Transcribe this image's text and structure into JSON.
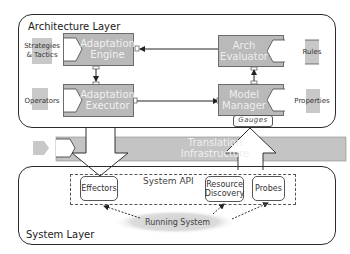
{
  "architecture_layer": {
    "title": "Architecture Layer",
    "components": {
      "adaptation_engine": [
        "Adaptation",
        "Engine"
      ],
      "adaptation_executor": [
        "Adaptation",
        "Executor"
      ],
      "arch_evaluator": [
        "Arch",
        "Evaluator"
      ],
      "model_manager": [
        "Model",
        "Manager"
      ]
    },
    "inputs_left": [
      {
        "label_lines": [
          "Strategies",
          "& Tactics"
        ]
      },
      {
        "label_lines": [
          "Operators"
        ]
      }
    ],
    "inputs_right": [
      {
        "label_lines": [
          "Rules"
        ]
      },
      {
        "label_lines": [
          "Properties"
        ]
      }
    ],
    "gauges_label": "Gauges"
  },
  "translation": {
    "label_lines": [
      "Translation",
      "Infrastructure"
    ]
  },
  "system_layer": {
    "title": "System Layer",
    "api_label": "System API",
    "boxes": {
      "effectors": [
        "Effectors"
      ],
      "resource_discovery": [
        "Resource",
        "Discovery"
      ],
      "probes": [
        "Probes"
      ]
    },
    "running_system": "Running System"
  },
  "colors": {
    "component_fill": "#b9b9b9",
    "component_text": "#f1f1f1",
    "band_fill": "#c4c4c4",
    "line": "#2b2b2b"
  }
}
